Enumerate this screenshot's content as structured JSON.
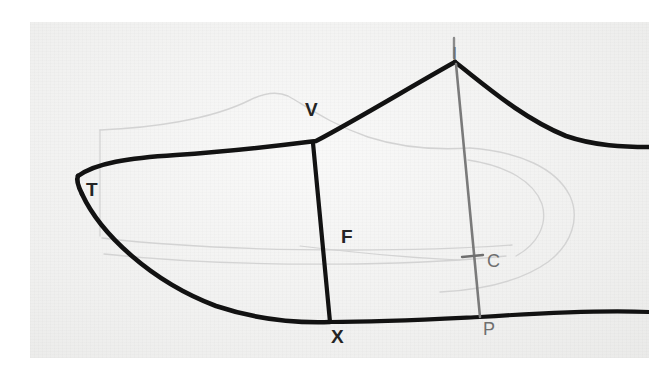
{
  "image": {
    "kind": "photograph-of-pencil-drawing",
    "subject": "shoe-last-side-profile-pattern",
    "paper_color": "#f2f2f1",
    "border_color": "#ffffff",
    "ink_color": "#121212",
    "pencil_ghost_color": "#d2d2d2",
    "gray_line_color": "#7a7a7a"
  },
  "labels": [
    {
      "id": "T",
      "text": "T",
      "x": 86,
      "y": 180,
      "size": 19,
      "weight": "bold",
      "color": "black",
      "name": "point-label-t"
    },
    {
      "id": "V",
      "text": "V",
      "x": 305,
      "y": 100,
      "size": 19,
      "weight": "bold",
      "color": "black",
      "name": "point-label-v"
    },
    {
      "id": "I",
      "text": "I",
      "x": 452,
      "y": 44,
      "size": 19,
      "weight": "normal",
      "color": "gray",
      "name": "point-label-i"
    },
    {
      "id": "F",
      "text": "F",
      "x": 341,
      "y": 227,
      "size": 19,
      "weight": "bold",
      "color": "black",
      "name": "point-label-f"
    },
    {
      "id": "C",
      "text": "C",
      "x": 487,
      "y": 252,
      "size": 18,
      "weight": "normal",
      "color": "gray",
      "name": "point-label-c"
    },
    {
      "id": "X",
      "text": "X",
      "x": 331,
      "y": 327,
      "size": 19,
      "weight": "bold",
      "color": "black",
      "name": "point-label-x"
    },
    {
      "id": "P",
      "text": "P",
      "x": 483,
      "y": 320,
      "size": 18,
      "weight": "normal",
      "color": "gray",
      "name": "point-label-p"
    }
  ],
  "strokes": {
    "top_curve": {
      "name": "upper-outline-t-to-i",
      "d": "M 78 176 C 96 163, 128 158, 176 155 C 238 151, 292 144, 316 141 C 356 120, 412 86, 455 62",
      "color": "#121212",
      "width": 4.6
    },
    "right_descent": {
      "name": "upper-outline-i-to-right-edge",
      "d": "M 455 62 C 486 86, 522 118, 566 136 C 595 146, 624 147, 649 147",
      "color": "#121212",
      "width": 4.6
    },
    "toe_tip": {
      "name": "toe-point-t",
      "d": "M 78 176 C 76 180, 78 186, 82 194",
      "color": "#121212",
      "width": 4.6
    },
    "bottom_curve_left": {
      "name": "lower-outline-t-to-x",
      "d": "M 82 194 C 100 233, 150 281, 216 306 C 258 320, 300 323, 330 322",
      "color": "#121212",
      "width": 4.6
    },
    "bottom_curve_right": {
      "name": "lower-outline-x-to-right-edge",
      "d": "M 330 322 C 382 322, 438 319, 480 317 C 540 313, 600 310, 649 312",
      "color": "#121212",
      "width": 4.2
    },
    "f_line": {
      "name": "measure-line-f-v-to-x",
      "d": "M 313 143 L 330 322",
      "color": "#121212",
      "width": 4.2
    },
    "i_p_line": {
      "name": "measure-line-i-to-p",
      "d": "M 456 64 L 480 317",
      "color": "#7a7a7a",
      "width": 2.6
    },
    "c_tick": {
      "name": "tick-mark-c",
      "d": "M 462 257 L 483 255",
      "color": "#6f6f6f",
      "width": 2.4
    },
    "i_label_stroke": {
      "name": "label-stroke-i",
      "d": "M 454 38 L 454 58",
      "color": "#8a8a8a",
      "width": 2.4
    }
  },
  "ghost_strokes": [
    {
      "name": "ghost-upper-vamp-arc",
      "d": "M 100 130 C 150 128, 210 120, 250 100 C 262 94, 275 90, 288 96 C 306 106, 330 124, 368 137 C 402 148, 440 150, 470 148",
      "width": 1.4
    },
    {
      "name": "ghost-left-vertical",
      "d": "M 100 130 L 100 236",
      "width": 1.3
    },
    {
      "name": "ghost-lower-band-upper",
      "d": "M 102 238 C 170 246, 260 250, 350 250 C 420 250, 470 248, 512 245",
      "width": 1.3
    },
    {
      "name": "ghost-lower-band-lower",
      "d": "M 104 254 C 180 262, 270 265, 356 264 C 420 263, 468 260, 506 256",
      "width": 1.3
    },
    {
      "name": "ghost-heel-curve-outer",
      "d": "M 470 148 C 520 152, 556 168, 570 196 C 580 218, 572 244, 548 262 C 520 282, 478 290, 440 292",
      "width": 1.4
    },
    {
      "name": "ghost-heel-curve-inner",
      "d": "M 468 160 C 508 166, 534 182, 542 204 C 548 224, 538 244, 516 256",
      "width": 1.3
    },
    {
      "name": "ghost-mid-seam",
      "d": "M 300 246 C 350 252, 410 258, 460 260",
      "width": 1.2
    }
  ]
}
